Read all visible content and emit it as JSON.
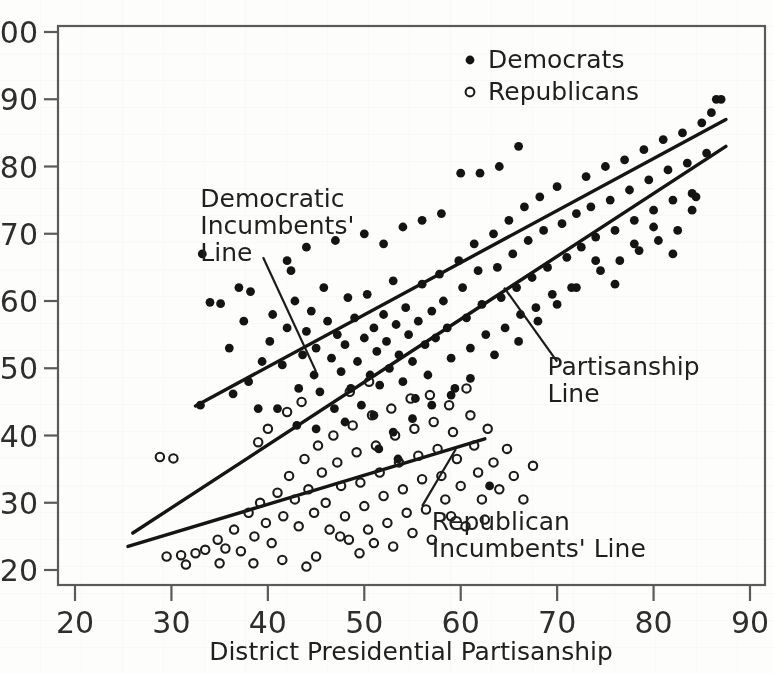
{
  "figure": {
    "kind": "scatter-plot-scan",
    "background_hex": "#fdfdfb",
    "ink_hex": "#141414"
  },
  "chart_data": {
    "type": "scatter",
    "title": "",
    "xlabel": "District Presidential Partisanship",
    "ylabel": "",
    "xlim": [
      20,
      90
    ],
    "ylim": [
      20,
      100
    ],
    "xticks": [
      20,
      30,
      40,
      50,
      60,
      70,
      80,
      90
    ],
    "yticks": [
      20,
      30,
      40,
      50,
      60,
      70,
      80,
      90,
      100
    ],
    "grid": false,
    "legend_position": "top-right",
    "legend": [
      {
        "name": "Democrats",
        "marker": "filled-circle",
        "color": "#141414"
      },
      {
        "name": "Republicans",
        "marker": "open-circle",
        "color": "#1b1b1b"
      }
    ],
    "series": [
      {
        "name": "Democrats",
        "marker": "filled-circle",
        "points": [
          [
            33.2,
            67.0
          ],
          [
            34.0,
            59.8
          ],
          [
            35.1,
            59.6
          ],
          [
            37.0,
            62.0
          ],
          [
            38.2,
            61.4
          ],
          [
            33.0,
            44.5
          ],
          [
            36.4,
            46.2
          ],
          [
            38.0,
            48.0
          ],
          [
            39.4,
            51.0
          ],
          [
            40.2,
            54.0
          ],
          [
            41.0,
            44.0
          ],
          [
            41.5,
            50.5
          ],
          [
            42.0,
            56.0
          ],
          [
            42.4,
            64.5
          ],
          [
            42.8,
            60.0
          ],
          [
            43.2,
            47.0
          ],
          [
            43.6,
            52.0
          ],
          [
            44.0,
            55.5
          ],
          [
            44.5,
            58.5
          ],
          [
            44.8,
            49.0
          ],
          [
            45.0,
            53.0
          ],
          [
            45.4,
            46.5
          ],
          [
            45.8,
            62.0
          ],
          [
            46.2,
            57.0
          ],
          [
            46.6,
            51.5
          ],
          [
            46.9,
            44.0
          ],
          [
            47.2,
            55.0
          ],
          [
            47.6,
            49.5
          ],
          [
            48.0,
            53.5
          ],
          [
            48.3,
            60.5
          ],
          [
            48.6,
            47.0
          ],
          [
            49.0,
            57.5
          ],
          [
            49.3,
            51.0
          ],
          [
            49.7,
            44.5
          ],
          [
            50.0,
            54.5
          ],
          [
            50.3,
            61.0
          ],
          [
            50.6,
            49.0
          ],
          [
            51.0,
            56.0
          ],
          [
            51.3,
            52.5
          ],
          [
            51.6,
            47.5
          ],
          [
            52.0,
            58.0
          ],
          [
            52.3,
            54.0
          ],
          [
            52.6,
            50.0
          ],
          [
            53.0,
            63.0
          ],
          [
            53.3,
            56.5
          ],
          [
            53.6,
            52.0
          ],
          [
            54.0,
            48.0
          ],
          [
            54.3,
            59.0
          ],
          [
            54.6,
            55.0
          ],
          [
            55.0,
            51.0
          ],
          [
            55.3,
            45.5
          ],
          [
            55.6,
            57.0
          ],
          [
            56.0,
            62.5
          ],
          [
            56.3,
            53.5
          ],
          [
            56.6,
            49.0
          ],
          [
            57.0,
            58.5
          ],
          [
            57.4,
            54.5
          ],
          [
            57.8,
            64.0
          ],
          [
            58.2,
            60.0
          ],
          [
            58.6,
            56.0
          ],
          [
            59.0,
            51.5
          ],
          [
            59.4,
            47.0
          ],
          [
            59.8,
            66.0
          ],
          [
            60.2,
            62.0
          ],
          [
            60.6,
            57.5
          ],
          [
            61.0,
            53.0
          ],
          [
            61.4,
            68.5
          ],
          [
            61.8,
            64.5
          ],
          [
            62.2,
            59.5
          ],
          [
            62.6,
            55.0
          ],
          [
            63.0,
            32.5
          ],
          [
            63.4,
            70.0
          ],
          [
            63.8,
            65.0
          ],
          [
            64.2,
            60.5
          ],
          [
            64.6,
            56.0
          ],
          [
            65.0,
            72.0
          ],
          [
            65.4,
            67.0
          ],
          [
            65.8,
            62.0
          ],
          [
            66.2,
            58.0
          ],
          [
            66.6,
            74.0
          ],
          [
            67.0,
            69.0
          ],
          [
            67.4,
            63.5
          ],
          [
            67.8,
            59.0
          ],
          [
            68.2,
            75.5
          ],
          [
            68.6,
            70.5
          ],
          [
            69.0,
            65.0
          ],
          [
            69.5,
            61.0
          ],
          [
            70.0,
            77.0
          ],
          [
            70.5,
            71.5
          ],
          [
            71.0,
            66.5
          ],
          [
            71.5,
            62.0
          ],
          [
            72.0,
            73.0
          ],
          [
            72.5,
            68.0
          ],
          [
            73.0,
            78.5
          ],
          [
            73.5,
            74.0
          ],
          [
            74.0,
            69.5
          ],
          [
            74.5,
            64.5
          ],
          [
            75.0,
            80.0
          ],
          [
            75.5,
            75.0
          ],
          [
            76.0,
            70.5
          ],
          [
            76.5,
            66.0
          ],
          [
            77.0,
            81.0
          ],
          [
            77.5,
            76.5
          ],
          [
            78.0,
            72.0
          ],
          [
            78.5,
            67.5
          ],
          [
            79.0,
            82.5
          ],
          [
            79.5,
            78.0
          ],
          [
            80.0,
            73.5
          ],
          [
            80.5,
            69.0
          ],
          [
            81.0,
            84.0
          ],
          [
            81.5,
            79.5
          ],
          [
            82.0,
            75.0
          ],
          [
            82.5,
            70.5
          ],
          [
            83.0,
            85.0
          ],
          [
            83.5,
            80.5
          ],
          [
            84.0,
            76.0
          ],
          [
            84.4,
            75.5
          ],
          [
            85.0,
            86.5
          ],
          [
            85.5,
            82.0
          ],
          [
            86.0,
            88.0
          ],
          [
            86.5,
            90.0
          ],
          [
            87.0,
            90.0
          ],
          [
            60.0,
            79.0
          ],
          [
            62.0,
            79.0
          ],
          [
            56.0,
            72.0
          ],
          [
            54.0,
            71.0
          ],
          [
            50.0,
            70.0
          ],
          [
            47.0,
            69.0
          ],
          [
            44.0,
            68.0
          ],
          [
            42.0,
            66.0
          ],
          [
            52.0,
            68.5
          ],
          [
            58.0,
            73.0
          ],
          [
            64.0,
            80.0
          ],
          [
            66.0,
            83.0
          ],
          [
            36.0,
            53.0
          ],
          [
            37.5,
            57.0
          ],
          [
            39.0,
            44.0
          ],
          [
            40.5,
            58.0
          ],
          [
            43.0,
            41.5
          ],
          [
            45.0,
            41.0
          ],
          [
            48.0,
            42.0
          ],
          [
            51.0,
            43.0
          ],
          [
            53.0,
            40.5
          ],
          [
            55.0,
            42.5
          ],
          [
            57.0,
            44.5
          ],
          [
            59.0,
            46.0
          ],
          [
            61.0,
            48.5
          ],
          [
            63.5,
            52.0
          ],
          [
            66.0,
            54.0
          ],
          [
            68.0,
            57.0
          ],
          [
            70.0,
            59.5
          ],
          [
            72.0,
            62.0
          ],
          [
            74.0,
            66.0
          ],
          [
            76.0,
            62.5
          ],
          [
            78.0,
            68.5
          ],
          [
            80.0,
            71.0
          ],
          [
            82.0,
            67.0
          ],
          [
            84.0,
            73.5
          ],
          [
            51.5,
            38.0
          ],
          [
            53.5,
            36.5
          ]
        ]
      },
      {
        "name": "Republicans",
        "marker": "open-circle",
        "points": [
          [
            28.8,
            36.8
          ],
          [
            30.2,
            36.6
          ],
          [
            29.5,
            22.0
          ],
          [
            31.0,
            22.2
          ],
          [
            32.5,
            22.5
          ],
          [
            33.5,
            23.0
          ],
          [
            34.8,
            24.5
          ],
          [
            35.6,
            23.2
          ],
          [
            36.5,
            26.0
          ],
          [
            37.2,
            22.8
          ],
          [
            38.0,
            28.5
          ],
          [
            38.6,
            25.0
          ],
          [
            39.2,
            30.0
          ],
          [
            39.8,
            27.0
          ],
          [
            40.4,
            24.0
          ],
          [
            41.0,
            31.5
          ],
          [
            41.6,
            28.0
          ],
          [
            42.2,
            34.0
          ],
          [
            42.8,
            30.5
          ],
          [
            43.2,
            26.5
          ],
          [
            43.8,
            36.5
          ],
          [
            44.2,
            32.0
          ],
          [
            44.8,
            28.5
          ],
          [
            45.2,
            38.5
          ],
          [
            45.6,
            34.5
          ],
          [
            46.0,
            30.0
          ],
          [
            46.4,
            26.0
          ],
          [
            46.8,
            40.0
          ],
          [
            47.2,
            36.0
          ],
          [
            47.6,
            32.5
          ],
          [
            48.0,
            28.0
          ],
          [
            48.4,
            24.5
          ],
          [
            48.8,
            41.5
          ],
          [
            49.2,
            37.5
          ],
          [
            49.6,
            33.0
          ],
          [
            50.0,
            29.5
          ],
          [
            50.4,
            26.0
          ],
          [
            50.8,
            43.0
          ],
          [
            51.2,
            38.5
          ],
          [
            51.6,
            34.5
          ],
          [
            52.0,
            31.0
          ],
          [
            52.4,
            27.0
          ],
          [
            52.8,
            44.0
          ],
          [
            53.2,
            40.0
          ],
          [
            53.6,
            36.0
          ],
          [
            54.0,
            32.0
          ],
          [
            54.4,
            28.5
          ],
          [
            54.8,
            45.5
          ],
          [
            55.2,
            41.0
          ],
          [
            55.6,
            37.0
          ],
          [
            56.0,
            33.5
          ],
          [
            56.4,
            29.0
          ],
          [
            56.8,
            46.0
          ],
          [
            57.2,
            42.0
          ],
          [
            57.6,
            38.0
          ],
          [
            58.0,
            34.0
          ],
          [
            58.4,
            30.5
          ],
          [
            58.8,
            44.5
          ],
          [
            59.2,
            40.5
          ],
          [
            59.6,
            36.5
          ],
          [
            60.0,
            32.5
          ],
          [
            60.6,
            47.0
          ],
          [
            61.0,
            43.0
          ],
          [
            61.4,
            38.5
          ],
          [
            61.8,
            34.5
          ],
          [
            62.2,
            30.5
          ],
          [
            62.8,
            41.0
          ],
          [
            63.4,
            36.0
          ],
          [
            64.0,
            32.0
          ],
          [
            64.8,
            38.0
          ],
          [
            65.5,
            34.0
          ],
          [
            66.5,
            30.5
          ],
          [
            67.5,
            35.5
          ],
          [
            60.5,
            26.5
          ],
          [
            57.0,
            24.5
          ],
          [
            53.0,
            23.5
          ],
          [
            49.5,
            22.5
          ],
          [
            45.0,
            22.0
          ],
          [
            41.5,
            21.5
          ],
          [
            38.5,
            21.0
          ],
          [
            35.0,
            21.0
          ],
          [
            31.5,
            20.8
          ],
          [
            44.0,
            20.5
          ],
          [
            47.5,
            25.0
          ],
          [
            51.0,
            24.0
          ],
          [
            55.0,
            25.5
          ],
          [
            59.0,
            28.0
          ],
          [
            62.5,
            27.5
          ],
          [
            43.5,
            45.0
          ],
          [
            42.0,
            43.5
          ],
          [
            40.0,
            41.0
          ],
          [
            39.0,
            39.0
          ],
          [
            48.5,
            46.5
          ],
          [
            50.5,
            48.0
          ]
        ]
      }
    ],
    "fit_lines": [
      {
        "name": "Democratic Incumbents' Line",
        "x_start": 32.5,
        "y_start": 44.4,
        "x_end": 87.5,
        "y_end": 87.0
      },
      {
        "name": "Partisanship Line",
        "x_start": 26.0,
        "y_start": 25.5,
        "x_end": 87.5,
        "y_end": 83.0
      },
      {
        "name": "Republican Incumbents' Line",
        "x_start": 25.5,
        "y_start": 23.5,
        "x_end": 62.5,
        "y_end": 39.5
      }
    ],
    "annotations": [
      {
        "id": "democratic-incumbents-line",
        "lines": [
          "Democratic",
          "Incumbents'",
          "Line"
        ],
        "text_x": 33,
        "text_y": 74,
        "leader_from_x": 39.5,
        "leader_from_y": 66.5,
        "leader_to_x": 45.0,
        "leader_to_y": 49.5
      },
      {
        "id": "partisanship-line",
        "lines": [
          "Partisanship",
          "Line"
        ],
        "text_x": 69,
        "text_y": 49,
        "leader_from_x": 64.5,
        "leader_from_y": 62.0,
        "leader_to_x": 70.0,
        "leader_to_y": 51.0
      },
      {
        "id": "republican-incumbents-line",
        "lines": [
          "Republican",
          "Incumbents' Line"
        ],
        "text_x": 57,
        "text_y": 26,
        "leader_from_x": 59.5,
        "leader_from_y": 38.0,
        "leader_to_x": 56.0,
        "leader_to_y": 29.5
      }
    ]
  }
}
